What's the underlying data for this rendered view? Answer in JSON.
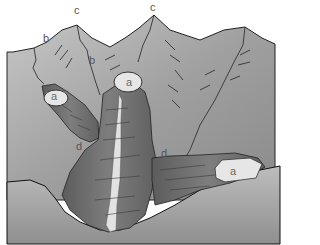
{
  "diagram": {
    "labels": [
      {
        "id": "c1",
        "text": "c",
        "x": 74,
        "y": 5
      },
      {
        "id": "c2",
        "text": "c",
        "x": 150,
        "y": 2
      },
      {
        "id": "b1",
        "text": "b",
        "x": 43,
        "y": 33
      },
      {
        "id": "b2",
        "text": "b",
        "x": 89,
        "y": 55
      },
      {
        "id": "a1",
        "text": "a",
        "x": 51,
        "y": 88
      },
      {
        "id": "a2",
        "text": "a",
        "x": 126,
        "y": 76
      },
      {
        "id": "a3",
        "text": "a",
        "x": 230,
        "y": 166
      },
      {
        "id": "d1",
        "text": "d",
        "x": 76,
        "y": 141
      },
      {
        "id": "d2",
        "text": "d",
        "x": 161,
        "y": 148
      }
    ]
  }
}
